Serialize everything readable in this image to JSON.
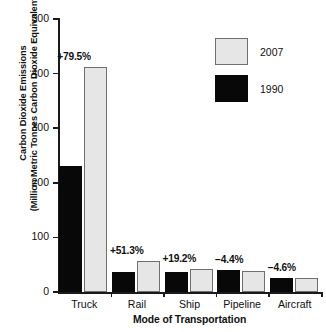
{
  "chart_data": {
    "type": "bar",
    "title": "",
    "xlabel": "Mode of Transportation",
    "ylabel_line1": "Carbon Dioxide Emissions",
    "ylabel_line2": "(Million Metric Tonnes Carbon Dioxide Equivalent)",
    "categories": [
      "Truck",
      "Rail",
      "Ship",
      "Pipeline",
      "Aircraft"
    ],
    "series": [
      {
        "name": "1990",
        "color": "#080808",
        "values": [
          230,
          37,
          36,
          40,
          26
        ]
      },
      {
        "name": "2007",
        "color": "#e6e6e6",
        "values": [
          412,
          56,
          43,
          38,
          25
        ]
      }
    ],
    "annotations": [
      "+79.5%",
      "+51.3%",
      "+19.2%",
      "−4.4%",
      "−4.6%"
    ],
    "ylim": [
      0,
      500
    ],
    "yticks": [
      0,
      100,
      200,
      300,
      400,
      500
    ],
    "ytick_labels": [
      "0",
      "100",
      "200",
      "300",
      "400",
      "500"
    ],
    "grid": false,
    "legend_position": "top-right",
    "legend_order": [
      "2007",
      "1990"
    ]
  },
  "axes": {
    "y_title_line1": "Carbon Dioxide Emissions",
    "y_title_line2": "(Million Metric Tonnes Carbon Dioxide Equivalent)",
    "x_title": "Mode of Transportation",
    "y_ticks": [
      "500",
      "400",
      "300",
      "200",
      "100",
      "0"
    ]
  },
  "legend": {
    "items": [
      {
        "label": "2007",
        "swatch": "light-gray"
      },
      {
        "label": "1990",
        "swatch": "black"
      }
    ]
  },
  "groups": [
    {
      "category": "Truck",
      "pct": "+79.5%",
      "v1990": 230,
      "v2007": 412
    },
    {
      "category": "Rail",
      "pct": "+51.3%",
      "v1990": 37,
      "v2007": 56
    },
    {
      "category": "Ship",
      "pct": "+19.2%",
      "v1990": 36,
      "v2007": 43
    },
    {
      "category": "Pipeline",
      "pct": "−4.4%",
      "v1990": 40,
      "v2007": 38
    },
    {
      "category": "Aircraft",
      "pct": "−4.6%",
      "v1990": 26,
      "v2007": 25
    }
  ],
  "colors": {
    "series_1990": "#080808",
    "series_2007": "#e6e6e6",
    "bar_outline": "#6f6f6f",
    "axis": "#1a1a1a",
    "text": "#111111",
    "background": "#ffffff"
  }
}
